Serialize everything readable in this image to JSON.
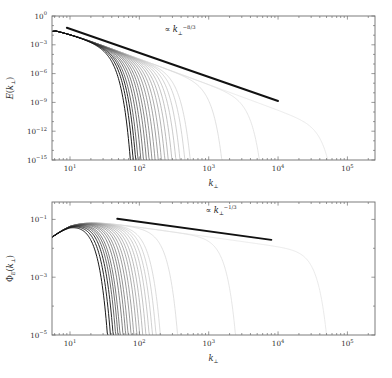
{
  "figure": {
    "background": "#ffffff",
    "frame_color": "#6e6e6e",
    "text_color": "#2b2b2b",
    "reference_line_color": "#111111"
  },
  "chart_data": [
    {
      "type": "line",
      "panel": "top",
      "title": "",
      "xlabel": "k⊥",
      "ylabel": "E(k⊥)",
      "xscale": "log",
      "yscale": "log",
      "xlim": [
        5.5,
        250000
      ],
      "ylim": [
        1e-15,
        1.0
      ],
      "grid": false,
      "legend": "none",
      "xtick_values": [
        10,
        100,
        1000,
        10000,
        100000
      ],
      "xtick_labels": [
        "10^1",
        "10^2",
        "10^3",
        "10^4",
        "10^5"
      ],
      "xtick_mantissas": [
        "10",
        "10",
        "10",
        "10",
        "10"
      ],
      "xtick_exponents": [
        "1",
        "2",
        "3",
        "4",
        "5"
      ],
      "ytick_values": [
        1.0,
        0.001,
        1e-06,
        1e-09,
        1e-12,
        1e-15
      ],
      "ytick_labels": [
        "10^0",
        "10^-3",
        "10^-6",
        "10^-9",
        "10^-12",
        "10^-15"
      ],
      "ytick_mantissas": [
        "10",
        "10",
        "10",
        "10",
        "10",
        "10"
      ],
      "ytick_exponents": [
        "0",
        "−3",
        "−6",
        "−9",
        "−12",
        "−15"
      ],
      "annotation": {
        "text": "∝ k⊥^-8/3",
        "symbol": "∝",
        "base": "k",
        "subscript": "⊥",
        "exponent": "−8/3"
      },
      "reference_line": {
        "slope": -2.6667,
        "x_start": 9.0,
        "x_end": 10000.0,
        "y_start": 0.06,
        "y_end": 1.4e-09
      },
      "series_description": "Family of energy spectra with progressively larger dissipation cutoff wavenumber; darkest curve cuts off earliest, lightest curve extends furthest.",
      "series_count": 22,
      "peak_x": 6.2,
      "peak_y": 0.055,
      "left_edge_y": 0.0022,
      "power_law_exponent": -2.6667,
      "cutoff_wavenumbers": [
        30,
        33,
        36,
        39,
        43,
        47,
        52,
        57,
        63,
        70,
        78,
        87,
        98,
        110,
        125,
        143,
        165,
        195,
        235,
        700,
        2600,
        30000
      ],
      "curve_shades": [
        "#0b0b0b",
        "#161616",
        "#222222",
        "#2d2d2d",
        "#393939",
        "#444444",
        "#505050",
        "#5b5b5b",
        "#676767",
        "#727272",
        "#7e7e7e",
        "#898989",
        "#959595",
        "#a0a0a0",
        "#ababab",
        "#b5b5b5",
        "#bebebe",
        "#c6c6c6",
        "#cecece",
        "#d5d5d5",
        "#dcdcdc",
        "#e2e2e2"
      ]
    },
    {
      "type": "line",
      "panel": "bottom",
      "title": "",
      "xlabel": "k⊥",
      "ylabel": "Φ_E(k⊥)",
      "xscale": "log",
      "yscale": "log",
      "xlim": [
        5.5,
        250000
      ],
      "ylim": [
        1e-05,
        0.4
      ],
      "grid": false,
      "legend": "none",
      "xtick_values": [
        10,
        100,
        1000,
        10000,
        100000
      ],
      "xtick_labels": [
        "10^1",
        "10^2",
        "10^3",
        "10^4",
        "10^5"
      ],
      "xtick_mantissas": [
        "10",
        "10",
        "10",
        "10",
        "10"
      ],
      "xtick_exponents": [
        "1",
        "2",
        "3",
        "4",
        "5"
      ],
      "ytick_values": [
        0.1,
        0.001,
        1e-05
      ],
      "ytick_labels": [
        "10^-1",
        "10^-3",
        "10^-5"
      ],
      "ytick_mantissas": [
        "10",
        "10",
        "10"
      ],
      "ytick_exponents": [
        "−1",
        "−3",
        "−5"
      ],
      "annotation": {
        "text": "∝ k⊥^-1/3",
        "symbol": "∝",
        "base": "k",
        "subscript": "⊥",
        "exponent": "−1/3"
      },
      "reference_line": {
        "slope": -0.3333,
        "x_start": 48.0,
        "x_end": 8000.0,
        "y_start": 0.105,
        "y_end": 0.0195
      },
      "series_description": "Family of flux-like spectra sharing a shallow k^-1/3 plateau, each terminating at its own cutoff wavenumber.",
      "series_count": 22,
      "peak_x": 10.0,
      "peak_y": 0.115,
      "left_edge_y": 0.022,
      "power_law_exponent": -0.3333,
      "cutoff_wavenumbers": [
        19,
        21,
        23,
        25,
        27,
        29,
        32,
        35,
        38,
        42,
        46,
        51,
        56,
        62,
        69,
        77,
        86,
        97,
        112,
        200,
        1400,
        30000
      ],
      "curve_shades": [
        "#0b0b0b",
        "#161616",
        "#222222",
        "#2d2d2d",
        "#393939",
        "#444444",
        "#505050",
        "#5b5b5b",
        "#676767",
        "#727272",
        "#7e7e7e",
        "#898989",
        "#959595",
        "#a0a0a0",
        "#ababab",
        "#b5b5b5",
        "#bebebe",
        "#c6c6c6",
        "#cecece",
        "#d5d5d5",
        "#dcdcdc",
        "#e2e2e2"
      ]
    }
  ]
}
